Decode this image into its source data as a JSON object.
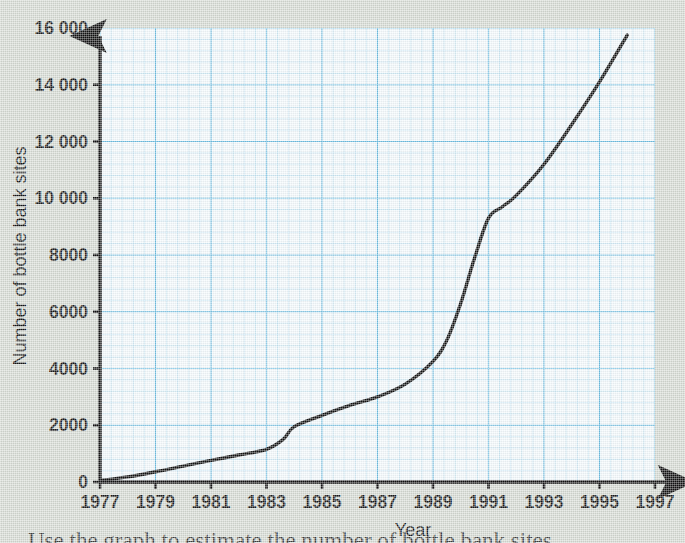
{
  "chart_data": {
    "type": "line",
    "title": "",
    "xlabel": "Year",
    "ylabel": "Number of bottle bank sites",
    "xlim": [
      1977,
      1997
    ],
    "ylim": [
      0,
      16000
    ],
    "grid": true,
    "grid_color": "#8fcbe8",
    "line_color": "#101010",
    "legend": "none",
    "x_ticks": [
      "1977",
      "1979",
      "1981",
      "1983",
      "1985",
      "1987",
      "1989",
      "1991",
      "1993",
      "1995",
      "1997"
    ],
    "y_ticks": [
      "0",
      "2000",
      "4000",
      "6000",
      "8000",
      "10000",
      "12000",
      "14000",
      "16000"
    ],
    "y_tick_display": [
      "0",
      "2000",
      "4000",
      "6000",
      "8000",
      "10 000",
      "12 000",
      "14 000",
      "16 000"
    ],
    "x": [
      1977,
      1978,
      1979,
      1980,
      1981,
      1982,
      1983,
      1983.6,
      1984,
      1985,
      1986,
      1987,
      1988,
      1989,
      1989.5,
      1990,
      1990.5,
      1991,
      1991.5,
      1992,
      1993,
      1994,
      1995,
      1996
    ],
    "values": [
      50,
      180,
      360,
      560,
      760,
      950,
      1150,
      1500,
      1950,
      2350,
      2700,
      3000,
      3450,
      4250,
      5000,
      6300,
      7900,
      9300,
      9700,
      10100,
      11200,
      12600,
      14100,
      15750
    ],
    "series": [
      {
        "name": "Bottle bank sites",
        "values": [
          50,
          180,
          360,
          560,
          760,
          950,
          1150,
          1500,
          1950,
          2350,
          2700,
          3000,
          3450,
          4250,
          5000,
          6300,
          7900,
          9300,
          9700,
          10100,
          11200,
          12600,
          14100,
          15750
        ]
      }
    ],
    "annotations": []
  },
  "axes": {
    "x_title": "Year",
    "y_title": "Number of bottle bank sites"
  },
  "caption": {
    "text": "Use the graph to estimate the number of bottle bank sites"
  }
}
